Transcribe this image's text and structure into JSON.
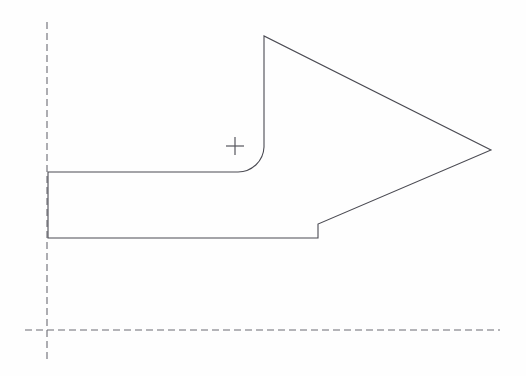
{
  "canvas": {
    "width": 526,
    "height": 376,
    "background_color": "#fefefe",
    "title": "CAD Profile View"
  },
  "style": {
    "outline_color": "#4a4a52",
    "outline_width": 1.1,
    "centerline_color": "#6b6b73",
    "centerline_width": 1.1,
    "centerline_dash": "7 4",
    "marker_color": "#55555d",
    "marker_width": 1.2
  },
  "drawing": {
    "description": "Arrow-shaped profile outline with vertical and horizontal centerlines and a crosshair reference marker",
    "profile": {
      "name": "arrow-profile-outline",
      "path": "M 48 172 L 48 238 L 318 238 L 318 224 L 491 150 L 264 36 L 264 147 A 26 26 0 0 1 238 172 Z",
      "vertices": [
        {
          "label": "top-left-shaft",
          "x": 48,
          "y": 172
        },
        {
          "label": "bottom-left-shaft",
          "x": 48,
          "y": 238
        },
        {
          "label": "notch-bottom",
          "x": 318,
          "y": 238
        },
        {
          "label": "notch-step-top",
          "x": 318,
          "y": 224
        },
        {
          "label": "arrow-tip",
          "x": 491,
          "y": 150
        },
        {
          "label": "arrow-upper-vertex",
          "x": 264,
          "y": 36
        },
        {
          "label": "flank-fillet-start",
          "x": 264,
          "y": 147
        },
        {
          "label": "fillet-end",
          "x": 238,
          "y": 172
        }
      ],
      "fillet_radius": 26
    },
    "centerlines": [
      {
        "name": "vertical-centerline",
        "orientation": "vertical",
        "x": 47,
        "y1": 22,
        "y2": 360
      },
      {
        "name": "horizontal-centerline",
        "orientation": "horizontal",
        "y": 330,
        "x1": 25,
        "x2": 500
      }
    ],
    "markers": [
      {
        "name": "center-crosshair-marker",
        "type": "crosshair",
        "x": 235,
        "y": 146,
        "size": 18
      }
    ]
  }
}
